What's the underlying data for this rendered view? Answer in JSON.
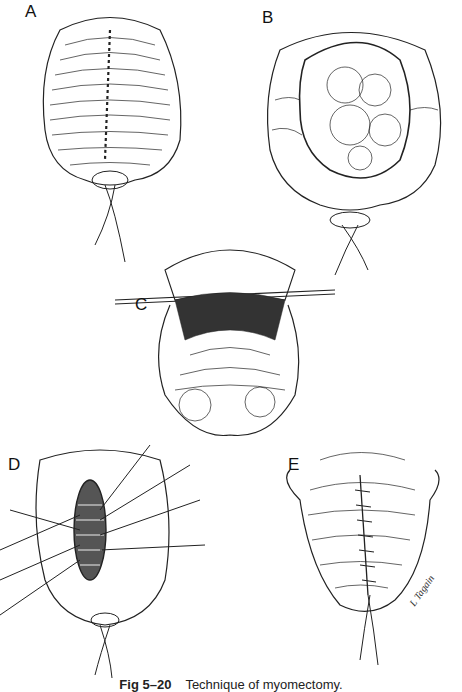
{
  "figure": {
    "panels": [
      {
        "id": "A",
        "label": "A"
      },
      {
        "id": "B",
        "label": "B"
      },
      {
        "id": "C",
        "label": "C"
      },
      {
        "id": "D",
        "label": "D"
      },
      {
        "id": "E",
        "label": "E"
      }
    ],
    "caption": {
      "number": "Fig 5–20",
      "text": "Technique of myomectomy."
    },
    "signature": "L Tagain"
  }
}
